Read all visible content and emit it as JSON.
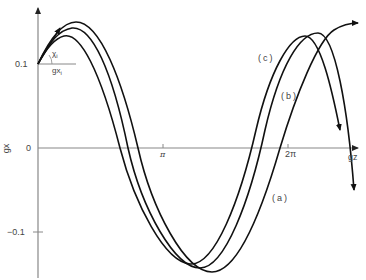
{
  "diagram": {
    "type": "phase-shifted oscillation curves",
    "axes": {
      "y_label": "gx",
      "x_label": "gz",
      "y_ticks": [
        "0.1",
        "0",
        "−0.1"
      ],
      "x_ticks": [
        "π",
        "2π"
      ]
    },
    "annotations": {
      "initial_angle": "χ",
      "initial_angle_sub": "i",
      "initial_value": "gx",
      "initial_value_sub": "i"
    },
    "curves": [
      {
        "id": "a",
        "label": "(a)"
      },
      {
        "id": "b",
        "label": "(b)"
      },
      {
        "id": "c",
        "label": "(c)"
      }
    ],
    "colors": {
      "curve": "#111111",
      "axis": "#777777",
      "text": "#444444"
    }
  }
}
